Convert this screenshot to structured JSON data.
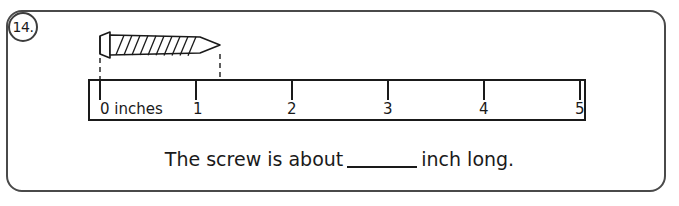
{
  "question": {
    "number": "14.",
    "prompt_before": "The screw is about",
    "prompt_after": "inch long.",
    "blank": ""
  },
  "ruler": {
    "unit_label": "0 inches",
    "tick_labels": [
      "1",
      "2",
      "3",
      "4",
      "5"
    ],
    "tick_values": [
      0,
      1,
      2,
      3,
      4,
      5
    ],
    "measured_object": "screw",
    "object_end_value": 1.2,
    "line_color": "#1a1a1a"
  },
  "colors": {
    "border": "#4a4a4a",
    "ink": "#1a1a1a",
    "background": "#ffffff"
  }
}
